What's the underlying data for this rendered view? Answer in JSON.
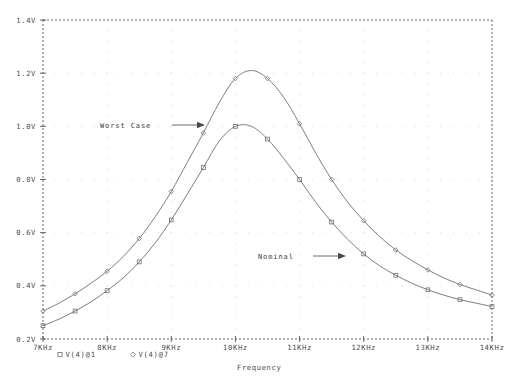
{
  "chart_data": {
    "type": "line",
    "title": "",
    "xlabel": "Frequency",
    "ylabel": "",
    "xlim": [
      7,
      14
    ],
    "ylim": [
      0.2,
      1.4
    ],
    "grid": true,
    "grid_style": "dotted",
    "legend_position": "below-axis-left",
    "x_tick_labels": [
      "7KHz",
      "8KHz",
      "9KHz",
      "10KHz",
      "11KHz",
      "12KHz",
      "13KHz",
      "14KHz"
    ],
    "x_ticks": [
      7,
      8,
      9,
      10,
      11,
      12,
      13,
      14
    ],
    "y_tick_labels": [
      "0.2V",
      "0.4V",
      "0.6V",
      "0.8V",
      "1.0V",
      "1.2V",
      "1.4V"
    ],
    "y_ticks": [
      0.2,
      0.4,
      0.6,
      0.8,
      1.0,
      1.2,
      1.4
    ],
    "x_unit": "KHz",
    "y_unit": "V",
    "series": [
      {
        "name": "V(4)@1",
        "label": "Worst Case",
        "marker": "diamond",
        "color": "#6e6e6e",
        "x": [
          7.0,
          7.25,
          7.5,
          7.75,
          8.0,
          8.25,
          8.5,
          8.75,
          9.0,
          9.25,
          9.5,
          9.75,
          10.0,
          10.25,
          10.5,
          10.75,
          11.0,
          11.25,
          11.5,
          11.75,
          12.0,
          12.25,
          12.5,
          12.75,
          13.0,
          13.25,
          13.5,
          13.75,
          14.0
        ],
        "y": [
          0.305,
          0.335,
          0.37,
          0.41,
          0.455,
          0.51,
          0.578,
          0.66,
          0.755,
          0.865,
          0.975,
          1.09,
          1.18,
          1.21,
          1.18,
          1.11,
          1.01,
          0.9,
          0.8,
          0.715,
          0.645,
          0.585,
          0.535,
          0.495,
          0.46,
          0.43,
          0.405,
          0.385,
          0.365
        ],
        "marker_x": [
          7.0,
          7.5,
          8.0,
          8.5,
          9.0,
          9.5,
          10.0,
          10.5,
          11.0,
          11.5,
          12.0,
          12.5,
          13.0,
          13.5,
          14.0
        ],
        "marker_y": [
          0.305,
          0.37,
          0.455,
          0.578,
          0.755,
          0.975,
          1.18,
          1.18,
          1.01,
          0.8,
          0.645,
          0.535,
          0.46,
          0.405,
          0.365
        ]
      },
      {
        "name": "V(4)@7",
        "label": "Nominal",
        "marker": "square",
        "color": "#6e6e6e",
        "x": [
          7.0,
          7.25,
          7.5,
          7.75,
          8.0,
          8.25,
          8.5,
          8.75,
          9.0,
          9.25,
          9.5,
          9.75,
          10.0,
          10.25,
          10.5,
          10.75,
          11.0,
          11.25,
          11.5,
          11.75,
          12.0,
          12.25,
          12.5,
          12.75,
          13.0,
          13.25,
          13.5,
          13.75,
          14.0
        ],
        "y": [
          0.25,
          0.275,
          0.305,
          0.34,
          0.382,
          0.43,
          0.49,
          0.562,
          0.648,
          0.745,
          0.845,
          0.945,
          1.0,
          1.0,
          0.952,
          0.88,
          0.8,
          0.715,
          0.64,
          0.575,
          0.52,
          0.475,
          0.44,
          0.41,
          0.385,
          0.365,
          0.348,
          0.335,
          0.322
        ]
      }
    ],
    "annotations": [
      {
        "text": "Worst Case",
        "points_to_series": "V(4)@1",
        "arrow": "right"
      },
      {
        "text": "Nominal",
        "points_to_series": "V(4)@7",
        "arrow": "right"
      }
    ],
    "legend": [
      {
        "marker": "square",
        "text": "V(4)@1"
      },
      {
        "marker": "diamond",
        "text": "V(4)@7"
      }
    ]
  }
}
